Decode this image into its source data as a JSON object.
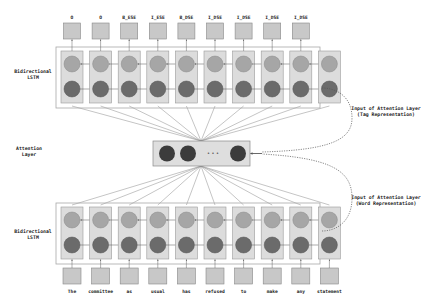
{
  "colors": {
    "io_box_fill": "#c8c8c8",
    "io_box_stroke": "#888888",
    "cell_fill": "#dcdcdc",
    "cell_stroke": "#9a9a9a",
    "outer_box_stroke": "#a8a8a8",
    "forward_unit": "#a6a6a6",
    "backward_unit": "#6b6b6b",
    "attention_unit": "#3c3c3c",
    "attention_fill": "#dedede",
    "line": "#8a8a8a",
    "dashed": "#555555"
  },
  "top_tags": [
    "O",
    "O",
    "B_ESE",
    "I_ESE",
    "B_DSE",
    "I_DSE",
    "I_DSE",
    "I_DSE",
    "I_DSE"
  ],
  "bottom_words": [
    "The",
    "committee",
    "as",
    "usual",
    "has",
    "refused",
    "to",
    "make",
    "any",
    "statement"
  ],
  "labels": {
    "top_lstm": [
      "Bidirectional",
      "LSTM"
    ],
    "bottom_lstm": [
      "Bidirectional",
      "LSTM"
    ],
    "attention": [
      "Attention",
      "Layer"
    ],
    "tag_input": [
      "Input of Attention Layer",
      "(Tag Representation)"
    ],
    "word_input": [
      "Input of Attention Layer",
      "(Word Representation)"
    ],
    "ellipsis": "• • •"
  }
}
